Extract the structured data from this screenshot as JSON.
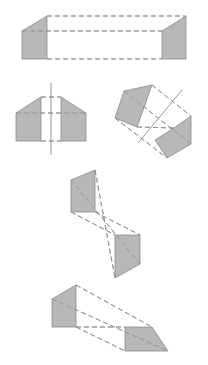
{
  "diagram": {
    "colors": {
      "background": "#ffffff",
      "face_fill": "#b8b8b8",
      "stroke": "#8a8a8a"
    },
    "figures": [
      {
        "id": "fig1",
        "label": "long prism",
        "faces": [
          [
            [
              22,
              31
            ],
            [
              47,
              16
            ],
            [
              47,
              59
            ],
            [
              22,
              59
            ]
          ],
          [
            [
              162,
              31
            ],
            [
              186,
              16
            ],
            [
              186,
              59
            ],
            [
              162,
              59
            ]
          ]
        ],
        "dashed": [
          [
            [
              47,
              16
            ],
            [
              186,
              16
            ]
          ],
          [
            [
              22,
              31
            ],
            [
              162,
              31
            ]
          ],
          [
            [
              47,
              59
            ],
            [
              162,
              59
            ]
          ]
        ],
        "solid": []
      },
      {
        "id": "fig2a",
        "label": "split prism with vertical axis",
        "faces": [
          [
            [
              16,
              113
            ],
            [
              41,
              97
            ],
            [
              41,
              141
            ],
            [
              16,
              141
            ]
          ],
          [
            [
              61,
              97
            ],
            [
              86,
              113
            ],
            [
              86,
              141
            ],
            [
              61,
              141
            ]
          ]
        ],
        "dashed": [
          [
            [
              41,
              97
            ],
            [
              61,
              97
            ]
          ],
          [
            [
              16,
              113
            ],
            [
              86,
              113
            ]
          ],
          [
            [
              41,
              141
            ],
            [
              61,
              141
            ]
          ]
        ],
        "solid": [
          [
            [
              51,
              83
            ],
            [
              51,
              155
            ]
          ]
        ]
      },
      {
        "id": "fig2b",
        "label": "rotated split prism with diagonal axis",
        "faces": [
          [
            [
              124,
              91
            ],
            [
              152,
              85
            ],
            [
              137,
              127
            ],
            [
              115,
              118
            ]
          ],
          [
            [
              155,
              140
            ],
            [
              174,
              128
            ],
            [
              191,
              116
            ],
            [
              191,
              144
            ],
            [
              167,
              158
            ]
          ]
        ],
        "dashed": [
          [
            [
              152,
              85
            ],
            [
              191,
              116
            ]
          ],
          [
            [
              124,
              91
            ],
            [
              191,
              144
            ]
          ],
          [
            [
              137,
              127
            ],
            [
              174,
              128
            ]
          ],
          [
            [
              115,
              118
            ],
            [
              167,
              158
            ]
          ]
        ],
        "solid": [
          [
            [
              182,
              90
            ],
            [
              138,
              143
            ]
          ]
        ]
      },
      {
        "id": "fig3",
        "label": "crossed pyramid projection",
        "faces": [
          [
            [
              95,
              170
            ],
            [
              71,
              180
            ],
            [
              71,
              212
            ],
            [
              95,
              212
            ]
          ],
          [
            [
              115,
              235
            ],
            [
              140,
              235
            ],
            [
              140,
              264
            ],
            [
              115,
              278
            ]
          ]
        ],
        "dashed": [
          [
            [
              95,
              170
            ],
            [
              115,
              278
            ]
          ],
          [
            [
              71,
              180
            ],
            [
              140,
              264
            ]
          ],
          [
            [
              95,
              212
            ],
            [
              140,
              235
            ]
          ],
          [
            [
              71,
              212
            ],
            [
              115,
              235
            ]
          ]
        ],
        "solid": []
      },
      {
        "id": "fig4",
        "label": "tapered prism",
        "faces": [
          [
            [
              76,
              285
            ],
            [
              52,
              299
            ],
            [
              52,
              327
            ],
            [
              76,
              327
            ]
          ],
          [
            [
              125,
              327
            ],
            [
              152,
              327
            ],
            [
              168,
              351
            ],
            [
              125,
              351
            ]
          ]
        ],
        "dashed": [
          [
            [
              76,
              285
            ],
            [
              152,
              327
            ]
          ],
          [
            [
              52,
              299
            ],
            [
              168,
              351
            ]
          ],
          [
            [
              76,
              327
            ],
            [
              125,
              327
            ]
          ],
          [
            [
              76,
              327
            ],
            [
              125,
              351
            ]
          ]
        ],
        "solid": []
      }
    ]
  }
}
